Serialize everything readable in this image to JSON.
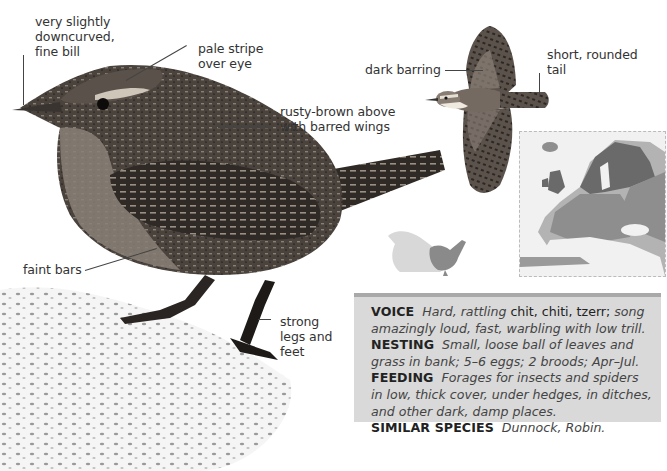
{
  "species_page": {
    "callouts": {
      "bill": [
        "very slightly",
        "downcurved,",
        "fine bill"
      ],
      "eye_stripe": [
        "pale stripe",
        "over eye"
      ],
      "upperparts": [
        "rusty-brown above",
        "with barred wings"
      ],
      "flanks": [
        "faint bars"
      ],
      "legs": [
        "strong",
        "legs and",
        "feet"
      ],
      "flight_wings": [
        "dark barring"
      ],
      "tail": [
        "short, rounded",
        "tail"
      ]
    },
    "illustrations": {
      "main_bird": "wren-perched-photo",
      "flight_bird": "wren-in-flight-illustration",
      "size_comparison": "size-comparison-silhouettes",
      "range_map": "europe-range-map"
    },
    "info_box": {
      "voice": {
        "heading": "VOICE",
        "text_italic_1": "Hard, rattling",
        "text_roman": " chit, chiti, tzerr;",
        "text_italic_2": " song amazingly loud, fast, warbling with low trill."
      },
      "nesting": {
        "heading": "NESTING",
        "text": "Small, loose ball of leaves and grass in bank; 5–6 eggs; 2 broods; Apr–Jul."
      },
      "feeding": {
        "heading": "FEEDING",
        "text": "Forages for insects and spiders in low, thick cover, under hedges, in ditches, and other dark, damp places."
      },
      "similar_species": {
        "heading": "SIMILAR SPECIES",
        "text": "Dunnock, Robin."
      }
    },
    "colors": {
      "info_bg": "#d9d9d9",
      "info_border": "#a9a9a9",
      "bird_dark": "#3a3530",
      "bird_mid": "#6b625a",
      "map_range_dark": "#6a6a6a",
      "map_range_mid": "#8e8e8e",
      "map_land": "#b5b5b5"
    }
  }
}
